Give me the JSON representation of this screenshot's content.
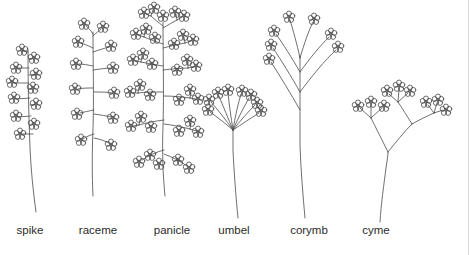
{
  "figure": {
    "background_color": "#ffffff",
    "ink_color": "#4a4a4a",
    "label_color": "#2b2b2b",
    "border_color": "#d8d8d8",
    "width": 469,
    "height": 255
  },
  "labels": [
    {
      "id": "spike",
      "text": "spike",
      "x": 30,
      "y": 232
    },
    {
      "id": "raceme",
      "text": "raceme",
      "x": 98,
      "y": 232
    },
    {
      "id": "panicle",
      "text": "panicle",
      "x": 172,
      "y": 232
    },
    {
      "id": "umbel",
      "text": "umbel",
      "x": 234,
      "y": 232
    },
    {
      "id": "corymb",
      "text": "corymb",
      "x": 309,
      "y": 232
    },
    {
      "id": "cyme",
      "text": "cyme",
      "x": 376,
      "y": 232
    }
  ],
  "diagram_data": {
    "type": "botanical-diagram",
    "subject": "inflorescence types",
    "drawing_style": "hand-drawn line art, black ink on white",
    "flower_glyph": "five-petaled blossom drawn as overlapping small circles",
    "items": [
      {
        "name": "spike",
        "description": "unbranched elongated axis bearing sessile flowers attached directly to the main stem",
        "stem": {
          "base_x": 36,
          "base_y": 212,
          "apex_x": 28,
          "apex_y": 48
        },
        "flower_count": 11,
        "branching": "none",
        "pedicels": "absent"
      },
      {
        "name": "raceme",
        "description": "unbranched elongated axis bearing flowers on short individual stalks (pedicels)",
        "stem": {
          "base_x": 93,
          "base_y": 196,
          "apex_x": 93,
          "apex_y": 30
        },
        "flower_count": 12,
        "branching": "none",
        "pedicels": "short, equal length"
      },
      {
        "name": "panicle",
        "description": "a branched raceme; each lateral branch itself carries several flowers",
        "stem": {
          "base_x": 165,
          "base_y": 196,
          "apex_x": 163,
          "apex_y": 20
        },
        "flower_count": 34,
        "branching": "compound, racemose",
        "pedicels": "on secondary branches"
      },
      {
        "name": "umbel",
        "description": "all flower stalks radiate from one common point at the stem apex, like umbrella ribs",
        "stem": {
          "base_x": 238,
          "base_y": 218,
          "apex_x": 233,
          "apex_y": 130
        },
        "node": {
          "x": 233,
          "y": 130
        },
        "ray_count": 8,
        "flower_count": 8,
        "branching": "single node",
        "pedicels": "equal length from one point"
      },
      {
        "name": "corymb",
        "description": "flower stalks arise at different heights but lengthen so all blossoms reach a flat-topped level",
        "stem": {
          "base_x": 305,
          "base_y": 218,
          "apex_x": 300,
          "apex_y": 56
        },
        "branch_count": 7,
        "flower_count": 7,
        "branching": "alternate along axis",
        "pedicels": "unequal, lower ones longest"
      },
      {
        "name": "cyme",
        "description": "determinate, repeatedly forking branches each ending in a terminal flower",
        "stem": {
          "base_x": 380,
          "base_y": 222,
          "apex_x": 388,
          "apex_y": 152
        },
        "fork": {
          "x": 388,
          "y": 152
        },
        "flower_count": 12,
        "branching": "dichotomous, determinate",
        "pedicels": "terminal on each fork"
      }
    ]
  }
}
